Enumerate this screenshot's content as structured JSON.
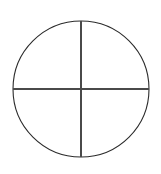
{
  "figure": {
    "canvas": {
      "width": 161,
      "height": 174,
      "background_color": "#ffffff"
    },
    "circle": {
      "label": "circle-outline",
      "center_x": 81,
      "center_y": 89,
      "radius": 68,
      "stroke_color": "#2b2b2b",
      "stroke_width": 1.1,
      "fill": "none"
    },
    "vertical_line": {
      "label": "vertical-diameter",
      "x": 81,
      "y_start": 21,
      "y_end": 157,
      "stroke_color": "#4a4a4a",
      "stroke_width": 2
    },
    "horizontal_line": {
      "label": "horizontal-diameter",
      "y": 89,
      "x_start": 13,
      "x_end": 149,
      "stroke_color": "#4a4a4a",
      "stroke_width": 2
    }
  }
}
